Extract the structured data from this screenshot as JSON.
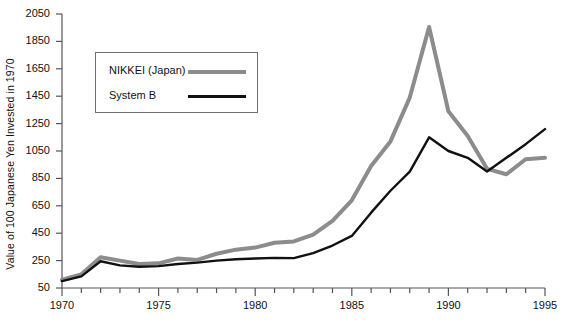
{
  "chart_data": {
    "type": "line",
    "title": "",
    "xlabel": "",
    "ylabel": "Value of 100 Japanese Yen Invested in 1970",
    "xlim": [
      1970,
      1995
    ],
    "ylim": [
      50,
      2050
    ],
    "grid": false,
    "legend_position": "upper-left-inside",
    "xticks_major": [
      1970,
      1975,
      1980,
      1985,
      1990,
      1995
    ],
    "xtick_labels": [
      "1970",
      "1975",
      "1980",
      "1985",
      "1990",
      "1995"
    ],
    "xticks_minor_step": 1,
    "yticks": [
      50,
      250,
      450,
      650,
      850,
      1050,
      1250,
      1450,
      1650,
      1850,
      2050
    ],
    "ytick_labels": [
      "50",
      "250",
      "450",
      "650",
      "850",
      "1050",
      "1250",
      "1450",
      "1650",
      "1850",
      "2050"
    ],
    "x": [
      1970,
      1971,
      1972,
      1973,
      1974,
      1975,
      1976,
      1977,
      1978,
      1979,
      1980,
      1981,
      1982,
      1983,
      1984,
      1985,
      1986,
      1987,
      1988,
      1989,
      1990,
      1991,
      1992,
      1993,
      1994,
      1995
    ],
    "series": [
      {
        "name": "NIKKEI (Japan)",
        "color": "#8c8c8c",
        "width": 4,
        "values": [
          110,
          150,
          275,
          250,
          225,
          230,
          265,
          255,
          300,
          330,
          345,
          380,
          390,
          440,
          540,
          690,
          940,
          1120,
          1440,
          1955,
          1340,
          1160,
          920,
          880,
          990,
          1000
        ]
      },
      {
        "name": "System B",
        "color": "#111111",
        "width": 2.4,
        "values": [
          100,
          135,
          245,
          215,
          205,
          210,
          225,
          235,
          250,
          260,
          265,
          270,
          268,
          305,
          360,
          430,
          600,
          760,
          900,
          1150,
          1050,
          1000,
          900,
          1000,
          1100,
          1210
        ]
      }
    ]
  },
  "axes": {
    "y_axis_label": "Value of 100 Japanese Yen Invested in 1970"
  },
  "legend": {
    "items": [
      {
        "label": "NIKKEI (Japan)",
        "color": "#8c8c8c"
      },
      {
        "label": "System B",
        "color": "#111111"
      }
    ]
  },
  "colors": {
    "nikkei": "#8c8c8c",
    "system_b": "#111111",
    "axis": "#555555",
    "text": "#111111",
    "background": "#ffffff"
  }
}
